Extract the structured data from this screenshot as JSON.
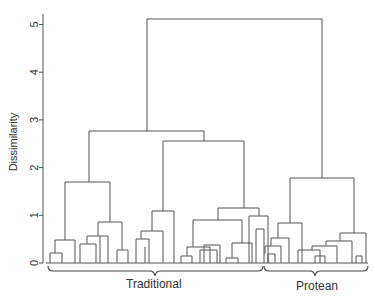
{
  "chart_data": {
    "type": "dendrogram",
    "title": "",
    "xlabel": "",
    "ylabel": "Dissimilarity",
    "ylim": [
      0,
      5.3
    ],
    "yticks": [
      0,
      1,
      2,
      3,
      4,
      5
    ],
    "grid": false,
    "groups": [
      {
        "name": "Traditional",
        "leaf_range": [
          0,
          38
        ]
      },
      {
        "name": "Protean",
        "leaf_range": [
          39,
          52
        ]
      }
    ],
    "top_level_merges": [
      {
        "description": "Traditional vs Protean",
        "height": 5.1
      },
      {
        "description": "Traditional main split",
        "height": 2.75
      },
      {
        "description": "Traditional right subtree",
        "height": 2.55
      },
      {
        "description": "Protean cluster",
        "height": 1.8
      },
      {
        "description": "Traditional left subtree",
        "height": 1.7
      }
    ]
  },
  "axis": {
    "ylabel": "Dissimilarity",
    "ticks": [
      "0",
      "1",
      "2",
      "3",
      "4",
      "5"
    ]
  },
  "labels": {
    "traditional": "Traditional",
    "protean": "Protean"
  },
  "colors": {
    "line": "#555555",
    "text": "#333333"
  },
  "segments": [
    [
      147,
      19,
      322,
      19
    ],
    [
      147,
      19,
      147,
      131
    ],
    [
      322,
      19,
      322,
      178
    ],
    [
      89,
      131,
      204,
      131
    ],
    [
      89,
      131,
      89,
      182
    ],
    [
      204,
      131,
      204,
      141
    ],
    [
      65,
      182,
      110,
      182
    ],
    [
      65,
      182,
      65,
      240
    ],
    [
      110,
      182,
      110,
      222
    ],
    [
      55,
      240,
      75,
      240
    ],
    [
      55,
      240,
      55,
      253
    ],
    [
      75,
      240,
      75,
      263
    ],
    [
      50,
      253,
      62,
      253
    ],
    [
      50,
      253,
      50,
      263
    ],
    [
      62,
      253,
      62,
      263
    ],
    [
      98,
      222,
      122,
      222
    ],
    [
      98,
      222,
      98,
      236
    ],
    [
      122,
      222,
      122,
      250
    ],
    [
      87,
      236,
      108,
      236
    ],
    [
      87,
      236,
      87,
      244
    ],
    [
      108,
      236,
      108,
      263
    ],
    [
      80,
      244,
      96,
      244
    ],
    [
      80,
      244,
      80,
      263
    ],
    [
      96,
      244,
      96,
      263
    ],
    [
      84,
      244,
      84,
      244
    ],
    [
      100,
      236,
      100,
      263
    ],
    [
      117,
      250,
      128,
      250
    ],
    [
      117,
      250,
      117,
      263
    ],
    [
      128,
      250,
      128,
      263
    ],
    [
      163,
      141,
      244,
      141
    ],
    [
      163,
      141,
      163,
      211
    ],
    [
      244,
      141,
      244,
      208
    ],
    [
      152,
      211,
      174,
      211
    ],
    [
      152,
      211,
      152,
      231
    ],
    [
      174,
      211,
      174,
      263
    ],
    [
      141,
      231,
      163,
      231
    ],
    [
      141,
      231,
      141,
      239
    ],
    [
      163,
      231,
      163,
      263
    ],
    [
      136,
      239,
      149,
      239
    ],
    [
      136,
      239,
      136,
      263
    ],
    [
      149,
      239,
      149,
      263
    ],
    [
      145,
      247,
      145,
      263
    ],
    [
      218,
      208,
      259,
      208
    ],
    [
      218,
      208,
      218,
      220
    ],
    [
      259,
      208,
      259,
      216
    ],
    [
      193,
      220,
      242,
      220
    ],
    [
      193,
      220,
      193,
      247
    ],
    [
      242,
      220,
      242,
      243
    ],
    [
      187,
      247,
      210,
      247
    ],
    [
      187,
      247,
      187,
      256
    ],
    [
      210,
      247,
      210,
      263
    ],
    [
      181,
      256,
      192,
      256
    ],
    [
      181,
      256,
      181,
      263
    ],
    [
      192,
      256,
      192,
      263
    ],
    [
      186,
      256,
      186,
      256
    ],
    [
      200,
      250,
      217,
      250
    ],
    [
      200,
      250,
      200,
      263
    ],
    [
      217,
      250,
      217,
      263
    ],
    [
      206,
      250,
      206,
      250
    ],
    [
      204,
      245,
      220,
      245
    ],
    [
      204,
      245,
      204,
      263
    ],
    [
      220,
      245,
      220,
      263
    ],
    [
      232,
      243,
      252,
      243
    ],
    [
      232,
      243,
      232,
      258
    ],
    [
      252,
      243,
      252,
      263
    ],
    [
      226,
      258,
      238,
      258
    ],
    [
      226,
      258,
      226,
      263
    ],
    [
      238,
      258,
      238,
      263
    ],
    [
      249,
      216,
      268,
      216
    ],
    [
      249,
      216,
      249,
      263
    ],
    [
      268,
      216,
      268,
      263
    ],
    [
      256,
      229,
      264,
      229
    ],
    [
      256,
      229,
      256,
      263
    ],
    [
      264,
      229,
      264,
      263
    ],
    [
      290,
      178,
      354,
      178
    ],
    [
      290,
      178,
      290,
      223
    ],
    [
      354,
      178,
      354,
      233
    ],
    [
      278,
      223,
      302,
      223
    ],
    [
      278,
      223,
      278,
      238
    ],
    [
      302,
      223,
      302,
      263
    ],
    [
      271,
      238,
      289,
      238
    ],
    [
      271,
      238,
      271,
      246
    ],
    [
      289,
      238,
      289,
      263
    ],
    [
      265,
      246,
      281,
      246
    ],
    [
      265,
      246,
      265,
      254
    ],
    [
      281,
      246,
      281,
      263
    ],
    [
      268,
      254,
      275,
      254
    ],
    [
      268,
      254,
      268,
      263
    ],
    [
      275,
      254,
      275,
      263
    ],
    [
      340,
      233,
      366,
      233
    ],
    [
      340,
      233,
      340,
      241
    ],
    [
      366,
      233,
      366,
      263
    ],
    [
      326,
      241,
      352,
      241
    ],
    [
      326,
      241,
      326,
      246
    ],
    [
      352,
      241,
      352,
      263
    ],
    [
      312,
      246,
      337,
      246
    ],
    [
      312,
      246,
      312,
      250
    ],
    [
      337,
      246,
      337,
      263
    ],
    [
      298,
      250,
      320,
      250
    ],
    [
      298,
      250,
      298,
      263
    ],
    [
      320,
      250,
      320,
      263
    ],
    [
      315,
      256,
      325,
      256
    ],
    [
      315,
      256,
      315,
      263
    ],
    [
      325,
      256,
      325,
      263
    ],
    [
      356,
      256,
      362,
      256
    ],
    [
      356,
      256,
      356,
      263
    ],
    [
      362,
      256,
      362,
      263
    ]
  ]
}
